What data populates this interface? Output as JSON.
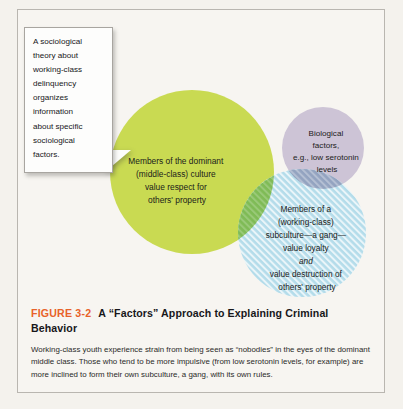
{
  "figure": {
    "number_label": "FIGURE 3-2",
    "title": "A “Factors” Approach to Explaining Criminal Behavior",
    "body": "Working-class youth experience strain from being seen as “nobodies” in the eyes of the dominant middle class. Those who tend to be more impulsive (from low serotonin levels, for example) are more inclined to form their own subculture, a gang, with its own rules."
  },
  "callout": {
    "text": "A sociological\ntheory about\nworking-class\ndelinquency\norganizes\ninformation\nabout specific\nsociological\nfactors."
  },
  "venn": {
    "circles": [
      {
        "id": "dominant-culture",
        "name": "Members of the dominant (middle-class) culture value respect for others' property",
        "lines": [
          "Members of the dominant",
          "(middle-class) culture",
          "value respect for",
          "others' property"
        ],
        "color": "#c9da52",
        "cx": 175,
        "cy": 163,
        "r": 82,
        "pattern": "solid"
      },
      {
        "id": "biological-factors",
        "name": "Biological factors, e.g., low serotonin levels",
        "lines": [
          "Biological",
          "factors,",
          "e.g., low serotonin",
          "levels"
        ],
        "color": "#cdc4d6",
        "cx": 306,
        "cy": 139,
        "r": 41,
        "pattern": "solid"
      },
      {
        "id": "working-class-subculture",
        "name": "Members of a (working-class) subculture—a gang—value loyalty and value destruction of others' property",
        "lines": [
          "Members of a",
          "(working-class)",
          "subculture—a gang—",
          "value loyalty",
          "and",
          "value destruction of",
          "others' property"
        ],
        "italic_line_index": 4,
        "color": "#add8e8",
        "cx": 285,
        "cy": 224,
        "r": 64,
        "pattern": "diagonal-hatch"
      }
    ],
    "overlaps": [
      {
        "id": "green-purple",
        "color": "#aeae72"
      },
      {
        "id": "green-blue",
        "color": "#7fbb56"
      },
      {
        "id": "purple-blue",
        "color": "#93a3c0"
      },
      {
        "id": "green-purple-blue",
        "color": "#9dba69"
      }
    ]
  },
  "colors": {
    "page_background": "#f4f2ed",
    "frame_border": "#b9b6b0",
    "accent_orange": "#e8622a",
    "text": "#17171a"
  }
}
